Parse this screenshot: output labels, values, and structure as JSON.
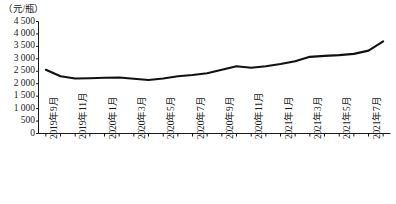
{
  "chart_data": {
    "type": "line",
    "title": "",
    "subtitle": "",
    "ylabel": "（元/瓶）",
    "xlabel": "",
    "ylim": [
      0,
      4500
    ],
    "ytick_step": 500,
    "ytick_labels": [
      "4 500",
      "4 000",
      "3 500",
      "3 000",
      "2 500",
      "2 000",
      "1 500",
      "1 000",
      "500",
      "0"
    ],
    "ytick_values": [
      4500,
      4000,
      3500,
      3000,
      2500,
      2000,
      1500,
      1000,
      500,
      0
    ],
    "grid": false,
    "legend": null,
    "legend_position": "none",
    "line_color": "#111111",
    "x": [
      "2019年9月",
      "2019年10月",
      "2019年11月",
      "2019年12月",
      "2020年1月",
      "2020年2月",
      "2020年3月",
      "2020年4月",
      "2020年5月",
      "2020年6月",
      "2020年7月",
      "2020年8月",
      "2020年9月",
      "2020年10月",
      "2020年11月",
      "2020年12月",
      "2021年1月",
      "2021年2月",
      "2021年3月",
      "2021年4月",
      "2021年5月",
      "2021年6月",
      "2021年7月",
      "2021年8月"
    ],
    "xtick_labels": [
      "2019年9月",
      "2019年11月",
      "2020年1月",
      "2020年3月",
      "2020年5月",
      "2020年7月",
      "2020年9月",
      "2020年11月",
      "2021年1月",
      "2021年3月",
      "2021年5月",
      "2021年7月"
    ],
    "xtick_label_interval": 2,
    "values": [
      2560,
      2300,
      2210,
      2220,
      2240,
      2250,
      2200,
      2150,
      2210,
      2300,
      2350,
      2420,
      2560,
      2700,
      2640,
      2700,
      2790,
      2900,
      3080,
      3120,
      3150,
      3200,
      3330,
      3700
    ]
  }
}
